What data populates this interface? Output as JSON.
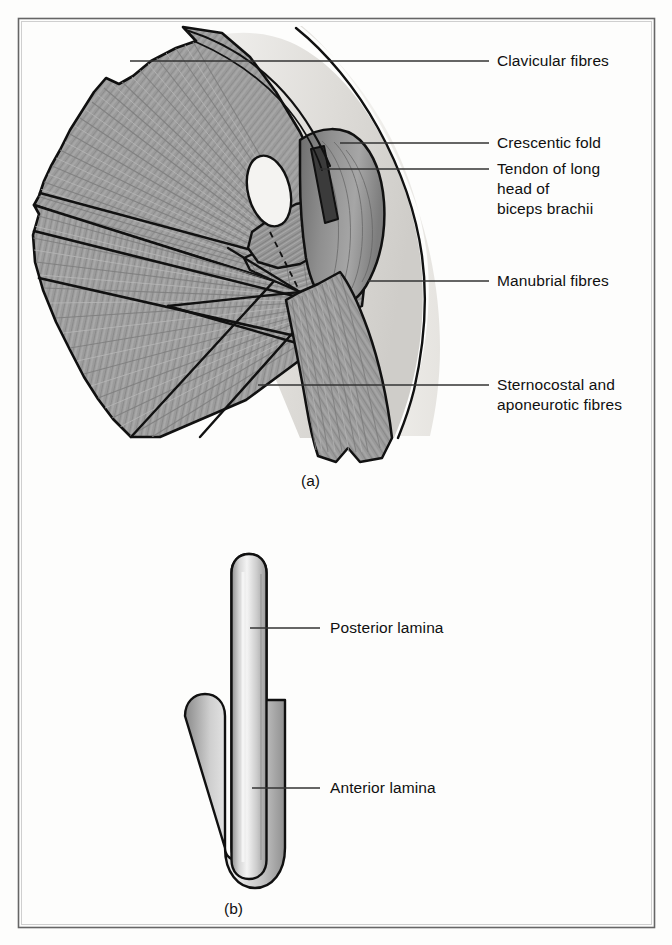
{
  "figure": {
    "panels": [
      {
        "id": "a",
        "caption": "(a)",
        "labels": [
          {
            "name": "clavicular-fibres",
            "text": "Clavicular fibres"
          },
          {
            "name": "crescentic-fold",
            "text": "Crescentic fold"
          },
          {
            "name": "tendon-long-head-biceps",
            "line1": "Tendon of long",
            "line2": "head of",
            "line3": "biceps brachii"
          },
          {
            "name": "manubrial-fibres",
            "text": "Manubrial fibres"
          },
          {
            "name": "sternocostal-aponeurotic-fibres",
            "line1": "Sternocostal and",
            "line2": "aponeurotic fibres"
          }
        ]
      },
      {
        "id": "b",
        "caption": "(b)",
        "labels": [
          {
            "name": "posterior-lamina",
            "text": "Posterior lamina"
          },
          {
            "name": "anterior-lamina",
            "text": "Anterior lamina"
          }
        ]
      }
    ]
  },
  "colors": {
    "page_background": "#fdfdfc",
    "frame_border": "#5a5a5a",
    "muscle_fill": "#9a9a9a",
    "muscle_fill_light": "#b4b4b4",
    "muscle_fill_dark": "#7c7c7c",
    "skin_fill": "#eceae6",
    "outline": "#111111",
    "leader_line": "#333333",
    "tendon_fill": "#3b3b3b",
    "label_text": "#101010",
    "lamina_fill_light": "#efefef",
    "lamina_fill_mid": "#b9b9b9"
  }
}
